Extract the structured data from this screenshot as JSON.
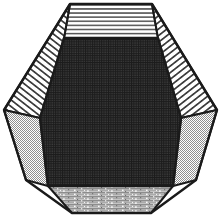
{
  "figure": {
    "canvas": {
      "width": 221,
      "height": 218,
      "background": "#ffffff"
    },
    "stroke": {
      "color": "#1a1a1a",
      "width": 2.0
    },
    "faces": [
      {
        "id": "top-face",
        "name": "top-face",
        "label": "Top face",
        "fill_style": "horizontal-hatch",
        "fill_color": "#4d4d4d",
        "background": "#ffffff",
        "points": "70,4 152,4 158,38 64,38"
      },
      {
        "id": "upper-left-face",
        "name": "upper-left-face",
        "label": "Upper left face",
        "fill_style": "diagonal-hatch-up",
        "fill_color": "#3a3a3a",
        "background": "#ffffff",
        "points": "70,4 64,38 40,118 4,110"
      },
      {
        "id": "upper-right-face",
        "name": "upper-right-face",
        "label": "Upper right face",
        "fill_style": "diagonal-hatch-down",
        "fill_color": "#3a3a3a",
        "background": "#ffffff",
        "points": "152,4 217,110 181,118 158,38"
      },
      {
        "id": "lower-left-face",
        "name": "lower-left-face",
        "label": "Lower left face",
        "fill_style": "checker-gray",
        "fill_color": "#9a9a9a",
        "background": "#ffffff",
        "points": "4,110 40,118 48,186 26,180"
      },
      {
        "id": "lower-right-face",
        "name": "lower-right-face",
        "label": "Lower right face",
        "fill_style": "checker-gray",
        "fill_color": "#9a9a9a",
        "background": "#ffffff",
        "points": "181,118 217,110 196,180 173,186"
      },
      {
        "id": "bottom-face",
        "name": "bottom-face",
        "label": "Bottom face",
        "fill_style": "speckle-gray",
        "fill_color": "#b5b5b5",
        "background": "#d9d9d9",
        "points": "48,186 173,186 151,213 72,213"
      },
      {
        "id": "front-hexagon-face",
        "name": "front-hexagon-face",
        "label": "Front hexagonal face",
        "fill_style": "dark-grid",
        "fill_color": "#2e2e2e",
        "background": "#343434",
        "points": "64,38 158,38 181,118 173,186 48,186 40,118"
      }
    ],
    "edges": [
      {
        "name": "edge-top-left",
        "from": "70,4",
        "to": "152,4"
      },
      {
        "name": "edge-upper-left-outer",
        "from": "70,4",
        "to": "4,110"
      },
      {
        "name": "edge-upper-right-outer",
        "from": "152,4",
        "to": "217,110"
      },
      {
        "name": "edge-left-outer",
        "from": "4,110",
        "to": "26,180"
      },
      {
        "name": "edge-right-outer",
        "from": "217,110",
        "to": "196,180"
      },
      {
        "name": "edge-bottom-left-outer",
        "from": "26,180",
        "to": "72,213"
      },
      {
        "name": "edge-bottom-right-outer",
        "from": "196,180",
        "to": "151,213"
      },
      {
        "name": "edge-bottom",
        "from": "72,213",
        "to": "151,213"
      },
      {
        "name": "edge-hex-top",
        "from": "64,38",
        "to": "158,38"
      },
      {
        "name": "edge-hex-upper-left",
        "from": "64,38",
        "to": "40,118"
      },
      {
        "name": "edge-hex-upper-right",
        "from": "158,38",
        "to": "181,118"
      },
      {
        "name": "edge-hex-lower-left",
        "from": "40,118",
        "to": "48,186"
      },
      {
        "name": "edge-hex-lower-right",
        "from": "181,118",
        "to": "173,186"
      },
      {
        "name": "edge-hex-bottom",
        "from": "48,186",
        "to": "173,186"
      },
      {
        "name": "edge-crease-top-left",
        "from": "70,4",
        "to": "64,38"
      },
      {
        "name": "edge-crease-top-right",
        "from": "152,4",
        "to": "158,38"
      },
      {
        "name": "edge-crease-left",
        "from": "4,110",
        "to": "40,118"
      },
      {
        "name": "edge-crease-right",
        "from": "217,110",
        "to": "181,118"
      },
      {
        "name": "edge-crease-bottom-left",
        "from": "26,180",
        "to": "48,186"
      },
      {
        "name": "edge-crease-bottom-right",
        "from": "196,180",
        "to": "173,186"
      }
    ]
  }
}
